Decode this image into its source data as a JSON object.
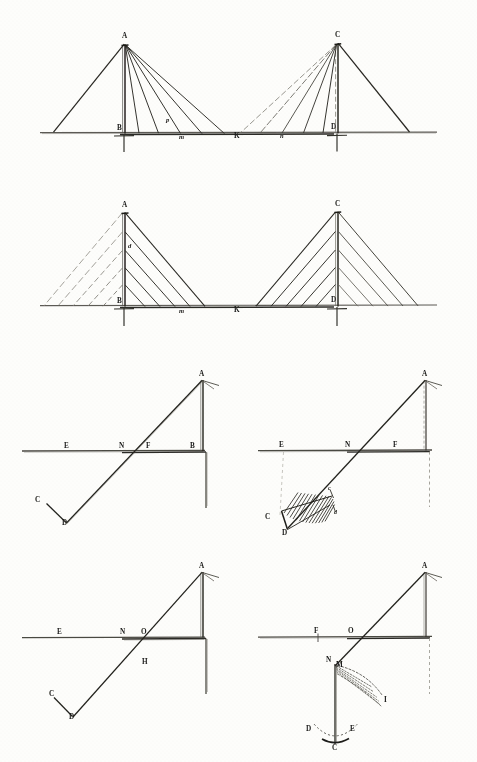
{
  "plate": {
    "title": "Cable-stayed bridge stay arrangements and anchorage studies",
    "background_color": "#fdfdfb",
    "ink_color": "#1a1a18",
    "faint_ink_color": "#9a9890",
    "figures": [
      {
        "id": "fig-1",
        "name": "fan-stay-bridge-elevation",
        "description": "Two towers with radiating fan stays meeting at mid-span",
        "labels": [
          {
            "text": "A",
            "x": 122,
            "y": 38,
            "style": "cap"
          },
          {
            "text": "C",
            "x": 335,
            "y": 37,
            "style": "cap"
          },
          {
            "text": "B",
            "x": 119,
            "y": 129,
            "style": "cap"
          },
          {
            "text": "D",
            "x": 332,
            "y": 128,
            "style": "cap"
          },
          {
            "text": "m",
            "x": 181,
            "y": 137,
            "style": "ital"
          },
          {
            "text": "K",
            "x": 236,
            "y": 136,
            "style": "cap"
          },
          {
            "text": "n",
            "x": 281,
            "y": 136,
            "style": "ital"
          },
          {
            "text": "p",
            "x": 168,
            "y": 121,
            "style": "ital"
          }
        ]
      },
      {
        "id": "fig-2",
        "name": "harp-stay-bridge-elevation",
        "description": "Two towers with parallel harp stays anchored at successive mast levels",
        "labels": [
          {
            "text": "A",
            "x": 122,
            "y": 206,
            "style": "cap"
          },
          {
            "text": "C",
            "x": 335,
            "y": 205,
            "style": "cap"
          },
          {
            "text": "B",
            "x": 119,
            "y": 302,
            "style": "cap"
          },
          {
            "text": "D",
            "x": 332,
            "y": 301,
            "style": "cap"
          },
          {
            "text": "m",
            "x": 181,
            "y": 311,
            "style": "ital"
          },
          {
            "text": "K",
            "x": 236,
            "y": 310,
            "style": "cap"
          },
          {
            "text": "d",
            "x": 130,
            "y": 246,
            "style": "ital"
          }
        ]
      },
      {
        "id": "fig-3",
        "name": "anchorage-detail-plain",
        "description": "Inclined back-stay crossing ground line to a buried anchor bar",
        "labels": [
          {
            "text": "A",
            "x": 201,
            "y": 374,
            "style": "cap"
          },
          {
            "text": "E",
            "x": 66,
            "y": 447,
            "style": "cap"
          },
          {
            "text": "N",
            "x": 122,
            "y": 447,
            "style": "cap"
          },
          {
            "text": "F",
            "x": 148,
            "y": 447,
            "style": "cap"
          },
          {
            "text": "B",
            "x": 192,
            "y": 447,
            "style": "cap"
          },
          {
            "text": "C",
            "x": 37,
            "y": 500,
            "style": "cap"
          },
          {
            "text": "D",
            "x": 64,
            "y": 522,
            "style": "cap"
          }
        ]
      },
      {
        "id": "fig-4",
        "name": "anchorage-detail-hatched",
        "description": "Same back-stay anchor with hatched wedge of resisting earth",
        "labels": [
          {
            "text": "A",
            "x": 424,
            "y": 374,
            "style": "cap"
          },
          {
            "text": "E",
            "x": 281,
            "y": 445,
            "style": "cap"
          },
          {
            "text": "N",
            "x": 347,
            "y": 445,
            "style": "cap"
          },
          {
            "text": "F",
            "x": 395,
            "y": 445,
            "style": "cap"
          },
          {
            "text": "C",
            "x": 267,
            "y": 517,
            "style": "cap"
          },
          {
            "text": "D",
            "x": 284,
            "y": 533,
            "style": "cap"
          },
          {
            "text": "c",
            "x": 329,
            "y": 492,
            "style": "sm"
          },
          {
            "text": "d",
            "x": 332,
            "y": 512,
            "style": "sm"
          }
        ]
      },
      {
        "id": "fig-5",
        "name": "anchorage-detail-moment-arm",
        "description": "Back-stay anchor annotated with points O and H defining the lever arm",
        "labels": [
          {
            "text": "A",
            "x": 201,
            "y": 566,
            "style": "cap"
          },
          {
            "text": "E",
            "x": 59,
            "y": 634,
            "style": "cap"
          },
          {
            "text": "N",
            "x": 123,
            "y": 634,
            "style": "cap"
          },
          {
            "text": "O",
            "x": 143,
            "y": 634,
            "style": "cap"
          },
          {
            "text": "H",
            "x": 144,
            "y": 662,
            "style": "cap"
          },
          {
            "text": "C",
            "x": 51,
            "y": 700,
            "style": "cap"
          },
          {
            "text": "D",
            "x": 71,
            "y": 716,
            "style": "cap"
          }
        ]
      },
      {
        "id": "fig-6",
        "name": "anchorage-detail-rotating-bar",
        "description": "Vertical anchor bar swinging about N with dotted arcs of rotation",
        "labels": [
          {
            "text": "A",
            "x": 424,
            "y": 566,
            "style": "cap"
          },
          {
            "text": "F",
            "x": 316,
            "y": 633,
            "style": "cap"
          },
          {
            "text": "O",
            "x": 350,
            "y": 633,
            "style": "cap"
          },
          {
            "text": "N",
            "x": 329,
            "y": 660,
            "style": "cap"
          },
          {
            "text": "M",
            "x": 339,
            "y": 664,
            "style": "cap"
          },
          {
            "text": "I",
            "x": 385,
            "y": 700,
            "style": "cap"
          },
          {
            "text": "D",
            "x": 309,
            "y": 729,
            "style": "cap"
          },
          {
            "text": "E",
            "x": 352,
            "y": 729,
            "style": "cap"
          },
          {
            "text": "C",
            "x": 330,
            "y": 746,
            "style": "cap"
          }
        ]
      }
    ]
  }
}
